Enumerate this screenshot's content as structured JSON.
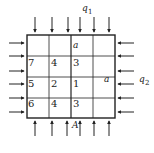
{
  "diagram": {
    "load_labels": {
      "top": "q",
      "top_sub": "1",
      "right": "q",
      "right_sub": "2"
    },
    "point_label": "A",
    "grid": {
      "rows": 4,
      "cols": 4,
      "cells": [
        [
          "",
          "",
          "a",
          ""
        ],
        [
          "7",
          "4",
          "3",
          ""
        ],
        [
          "5",
          "2",
          "1",
          "a"
        ],
        [
          "6",
          "4",
          "3",
          ""
        ]
      ]
    },
    "colors": {
      "line": "#222222",
      "background": "#ffffff"
    }
  }
}
